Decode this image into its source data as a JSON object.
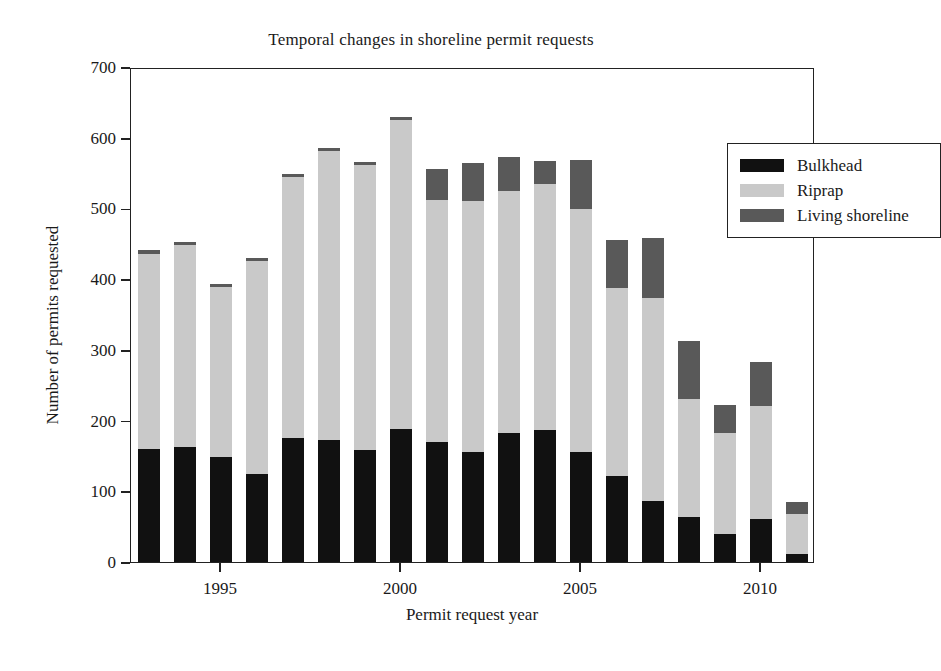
{
  "chart_data": {
    "type": "bar",
    "subtype": "stacked-vertical",
    "title": "Temporal changes in shoreline permit requests",
    "xlabel": "Permit request year",
    "ylabel": "Number of permits requested",
    "categories": [
      1993,
      1994,
      1995,
      1996,
      1997,
      1998,
      1999,
      2000,
      2001,
      2002,
      2003,
      2004,
      2005,
      2006,
      2007,
      2008,
      2009,
      2010,
      2011
    ],
    "xtick_labels": [
      "1995",
      "2000",
      "2005",
      "2010"
    ],
    "xtick_categories": [
      1995,
      2000,
      2005,
      2010
    ],
    "ytick_labels": [
      "0",
      "100",
      "200",
      "300",
      "400",
      "500",
      "600",
      "700"
    ],
    "ylim": [
      0,
      700
    ],
    "ytick_step": 100,
    "grid": false,
    "legend_position": "top-right",
    "series": [
      {
        "name": "Bulkhead",
        "color": "#111111",
        "values": [
          160,
          162,
          148,
          125,
          176,
          173,
          158,
          188,
          170,
          155,
          182,
          187,
          155,
          121,
          86,
          64,
          40,
          61,
          12
        ]
      },
      {
        "name": "Riprap",
        "color": "#c9c9c9",
        "values": [
          275,
          287,
          241,
          301,
          369,
          408,
          404,
          437,
          342,
          355,
          343,
          347,
          344,
          266,
          288,
          167,
          142,
          159,
          56
        ]
      },
      {
        "name": "Living shoreline",
        "color": "#595959",
        "values": [
          6,
          4,
          4,
          4,
          4,
          4,
          4,
          4,
          44,
          54,
          48,
          33,
          70,
          68,
          84,
          81,
          40,
          63,
          17
        ]
      }
    ],
    "totals": [
      441,
      453,
      393,
      430,
      549,
      585,
      566,
      629,
      556,
      564,
      573,
      567,
      569,
      455,
      458,
      312,
      222,
      283,
      85
    ]
  }
}
